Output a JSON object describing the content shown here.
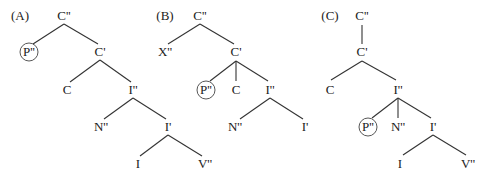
{
  "diagram": {
    "type": "syntax-trees",
    "colors": {
      "text": "#222222",
      "line": "#333333",
      "background": "#ffffff"
    },
    "trees": [
      {
        "id": "A",
        "label": "(A)",
        "label_pos": [
          20,
          20
        ],
        "nodes": [
          {
            "id": "a_cpp",
            "text": "C''",
            "x": 64,
            "y": 20
          },
          {
            "id": "a_ppp",
            "text": "P''",
            "x": 29,
            "y": 56,
            "circled": true
          },
          {
            "id": "a_cp",
            "text": "C'",
            "x": 100,
            "y": 56
          },
          {
            "id": "a_c",
            "text": "C",
            "x": 67,
            "y": 94
          },
          {
            "id": "a_ipp",
            "text": "I''",
            "x": 133,
            "y": 94
          },
          {
            "id": "a_npp",
            "text": "N''",
            "x": 101,
            "y": 131
          },
          {
            "id": "a_ip",
            "text": "I'",
            "x": 168,
            "y": 131
          },
          {
            "id": "a_i",
            "text": "I",
            "x": 138,
            "y": 168
          },
          {
            "id": "a_vpp",
            "text": "V''",
            "x": 205,
            "y": 168
          }
        ],
        "edges": [
          [
            64,
            24,
            33,
            44
          ],
          [
            64,
            24,
            98,
            44
          ],
          [
            100,
            60,
            70,
            82
          ],
          [
            100,
            60,
            131,
            82
          ],
          [
            133,
            98,
            104,
            119
          ],
          [
            133,
            98,
            166,
            119
          ],
          [
            168,
            135,
            140,
            156
          ],
          [
            168,
            135,
            202,
            156
          ]
        ]
      },
      {
        "id": "B",
        "label": "(B)",
        "label_pos": [
          165,
          20
        ],
        "nodes": [
          {
            "id": "b_cpp",
            "text": "C''",
            "x": 200,
            "y": 20
          },
          {
            "id": "b_xpp",
            "text": "X''",
            "x": 165,
            "y": 56
          },
          {
            "id": "b_cp",
            "text": "C'",
            "x": 236,
            "y": 56
          },
          {
            "id": "b_ppp",
            "text": "P''",
            "x": 206,
            "y": 94,
            "circled": true
          },
          {
            "id": "b_c",
            "text": "C",
            "x": 236,
            "y": 94
          },
          {
            "id": "b_ipp",
            "text": "I''",
            "x": 270,
            "y": 94
          },
          {
            "id": "b_npp",
            "text": "N''",
            "x": 235,
            "y": 131
          },
          {
            "id": "b_ip",
            "text": "I'",
            "x": 305,
            "y": 131
          }
        ],
        "edges": [
          [
            200,
            24,
            168,
            44
          ],
          [
            200,
            24,
            234,
            44
          ],
          [
            236,
            61,
            210,
            81
          ],
          [
            236,
            61,
            236,
            81
          ],
          [
            236,
            61,
            268,
            81
          ],
          [
            270,
            98,
            240,
            119
          ],
          [
            270,
            98,
            303,
            119
          ]
        ]
      },
      {
        "id": "C",
        "label": "(C)",
        "label_pos": [
          330,
          20
        ],
        "nodes": [
          {
            "id": "c_cpp",
            "text": "C''",
            "x": 362,
            "y": 20
          },
          {
            "id": "c_cp",
            "text": "C'",
            "x": 362,
            "y": 56
          },
          {
            "id": "c_c",
            "text": "C",
            "x": 330,
            "y": 94
          },
          {
            "id": "c_ipp",
            "text": "I''",
            "x": 398,
            "y": 94
          },
          {
            "id": "c_ppp",
            "text": "P''",
            "x": 368,
            "y": 131,
            "circled": true
          },
          {
            "id": "c_npp",
            "text": "N''",
            "x": 398,
            "y": 131
          },
          {
            "id": "c_ip",
            "text": "I'",
            "x": 433,
            "y": 131
          },
          {
            "id": "c_i",
            "text": "I",
            "x": 400,
            "y": 168
          },
          {
            "id": "c_vpp",
            "text": "V''",
            "x": 468,
            "y": 168
          }
        ],
        "edges": [
          [
            362,
            25,
            362,
            44
          ],
          [
            362,
            61,
            331,
            80
          ],
          [
            362,
            61,
            396,
            80
          ],
          [
            398,
            98,
            372,
            118
          ],
          [
            398,
            98,
            398,
            118
          ],
          [
            398,
            98,
            431,
            118
          ],
          [
            433,
            135,
            403,
            155
          ],
          [
            433,
            135,
            466,
            155
          ]
        ]
      }
    ]
  }
}
